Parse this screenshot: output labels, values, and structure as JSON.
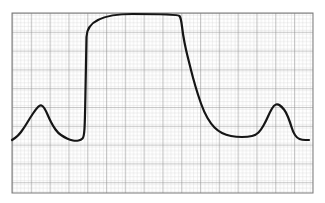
{
  "figure": {
    "type": "waveform-trace-on-grid-paper",
    "colors": {
      "background": "#ffffff",
      "grid_minor": "#c8c8c8",
      "grid_major": "#8a8a8a",
      "trace": "#151515"
    },
    "grid": {
      "x0": 12,
      "y0": 13,
      "x1": 313,
      "y1": 193,
      "minor_px": 3.76,
      "major_every": 5
    },
    "trace_points": [
      [
        12,
        140
      ],
      [
        18,
        136
      ],
      [
        24,
        128
      ],
      [
        30,
        118
      ],
      [
        36,
        109
      ],
      [
        40,
        105
      ],
      [
        43,
        106
      ],
      [
        46,
        111
      ],
      [
        49,
        118
      ],
      [
        53,
        126
      ],
      [
        58,
        133
      ],
      [
        64,
        137
      ],
      [
        70,
        140
      ],
      [
        76,
        141
      ],
      [
        81,
        140
      ],
      [
        84,
        137
      ],
      [
        85,
        120
      ],
      [
        86,
        60
      ],
      [
        87,
        14
      ],
      [
        178,
        14
      ],
      [
        181,
        18
      ],
      [
        183,
        35
      ],
      [
        186,
        50
      ],
      [
        189,
        62
      ],
      [
        193,
        78
      ],
      [
        198,
        95
      ],
      [
        204,
        112
      ],
      [
        211,
        124
      ],
      [
        218,
        131
      ],
      [
        226,
        135
      ],
      [
        236,
        137
      ],
      [
        248,
        137
      ],
      [
        256,
        135
      ],
      [
        261,
        130
      ],
      [
        266,
        121
      ],
      [
        270,
        112
      ],
      [
        274,
        105
      ],
      [
        278,
        104
      ],
      [
        282,
        107
      ],
      [
        286,
        112
      ],
      [
        290,
        122
      ],
      [
        293,
        132
      ],
      [
        297,
        138
      ],
      [
        302,
        140
      ],
      [
        309,
        140
      ]
    ],
    "trace_width": 2.2
  }
}
